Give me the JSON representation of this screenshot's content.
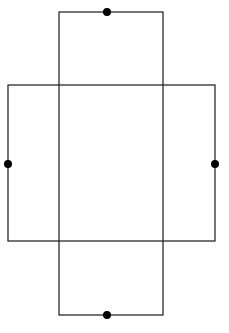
{
  "diagram": {
    "stroke_color": "#1a1a1a",
    "dot_color": "#000000",
    "vertical_rect": {
      "x": 59,
      "y": 12,
      "width": 104,
      "height": 303
    },
    "horizontal_rect": {
      "x": 8,
      "y": 85,
      "width": 207,
      "height": 156
    },
    "dots": [
      {
        "name": "top",
        "cx": 107,
        "cy": 12
      },
      {
        "name": "bottom",
        "cx": 107,
        "cy": 315
      },
      {
        "name": "left",
        "cx": 8,
        "cy": 164
      },
      {
        "name": "right",
        "cx": 215,
        "cy": 164
      }
    ]
  }
}
